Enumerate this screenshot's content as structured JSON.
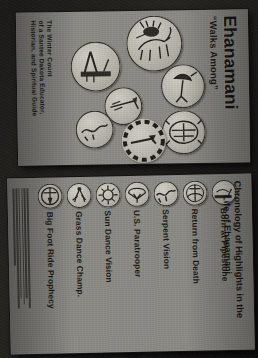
{
  "photo": {
    "description": "Photograph of two gray museum exhibit banner panels, rotated ninety degrees",
    "background_color": "#1b1a18",
    "panel_color": "#8b8a85",
    "ink_color": "#17150f"
  },
  "top_panel": {
    "title": "Ehanamani",
    "subtitle": "“Walks Among”",
    "credit_lines": [
      "The Winter Count",
      "of a Santee Dakota Educator,",
      "Historian, and Spiritual Guide"
    ],
    "glyphs": [
      {
        "name": "pipe-and-feather-glyph"
      },
      {
        "name": "horse-and-rider-glyph"
      },
      {
        "name": "bird-figure-glyph"
      },
      {
        "name": "arrow-and-bow-glyph"
      },
      {
        "name": "serpent-glyph"
      },
      {
        "name": "turtle-shield-glyph"
      },
      {
        "name": "dashed-circle-wheel-glyph"
      }
    ]
  },
  "bottom_panel": {
    "title_line_1": "Chronology of Highlights in the",
    "title_line_2": "Life of Ehanamani",
    "entries": [
      {
        "label": "Born at Pipestone",
        "icon": "pipestone-icon"
      },
      {
        "label": "Return from Death",
        "icon": "return-from-death-icon"
      },
      {
        "label": "Serpent Vision",
        "icon": "serpent-vision-icon"
      },
      {
        "label": "U.S. Paratrooper",
        "icon": "paratrooper-icon"
      },
      {
        "label": "Sun Dance Vision",
        "icon": "sun-dance-icon"
      },
      {
        "label": "Grass Dance Champ.",
        "icon": "grass-dance-icon"
      },
      {
        "label": "Big Foot Ride Prophecy",
        "icon": "big-foot-ride-icon"
      }
    ],
    "fineprint": "illegible descriptive paragraph"
  }
}
